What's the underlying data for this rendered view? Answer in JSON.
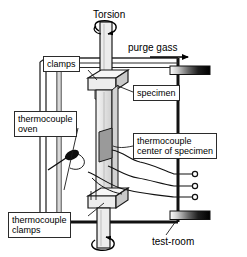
{
  "diagram": {
    "type": "technical-schematic",
    "canvas": {
      "width": 247,
      "height": 257
    },
    "colors": {
      "stroke": "#1a1a1a",
      "frame": "#111111",
      "specimen_fill": "#e3e3e3",
      "clamp_fill": "#f2f2f2",
      "clamp_shade": "#c9c9c9",
      "thermocouple_patch": "#9a9a9a",
      "heater_gradient_start": "#ffffff",
      "heater_gradient_end": "#000000",
      "label_border": "#2b2b2b",
      "label_background": "#ffffff",
      "background": "#ffffff"
    }
  },
  "labels": {
    "torsion": "Torsion",
    "purge_gas": "purge gass",
    "clamps": "clamps",
    "specimen": "specimen",
    "thermocouple_oven": "thermocouple\noven",
    "thermocouple_center_of_specimen": "thermocouple\ncenter of specimen",
    "thermocouple_clamps": "thermocouple\nclamps",
    "test_room": "test-room"
  },
  "components": {
    "drive_shaft_top": "vertical drive shaft entering from top",
    "drive_shaft_bottom": "vertical drive shaft exiting at bottom",
    "rotation_arrow_top": "circular torsion rotation arrow at top of shaft",
    "rotation_arrow_bottom": "circular torsion rotation arrow at bottom of shaft",
    "purge_gas_arrow": "horizontal arrow pointing right indicating purge gas flow",
    "upper_clamp": "isometric clamp block gripping top of specimen",
    "lower_clamp": "isometric clamp block gripping bottom of specimen",
    "specimen_column": "vertical specimen bar between clamps",
    "thermocouple_patch": "shaded patch at center of specimen",
    "oven_wall": "vertical double line representing oven wall at left",
    "oven_probe": "black teardrop probe tip of oven thermocouple",
    "heater_top": "gradient heating element bar at upper right",
    "heater_bottom": "gradient heating element bar at lower right",
    "test_room_frame": "rectangular frame enclosing the apparatus",
    "terminal_count": 3,
    "terminals": "three small circular thermocouple terminals at right edge",
    "wires": "three wavy thermocouple lead wires routed to the terminals"
  }
}
